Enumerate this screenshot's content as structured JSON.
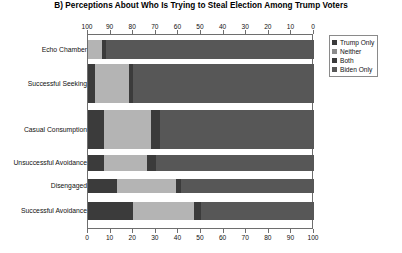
{
  "chart_data": {
    "type": "bar",
    "orientation": "horizontal",
    "stacked": true,
    "stack_mode": "percent",
    "title": "B) Perceptions About Who Is Trying to Steal Election Among Trump Voters",
    "xlabel": "",
    "ylabel": "",
    "xlim": [
      0,
      100
    ],
    "grid": false,
    "legend_position": "right",
    "top_axis": {
      "reversed": true,
      "ticks": [
        100,
        90,
        80,
        70,
        60,
        50,
        40,
        30,
        20,
        10,
        0
      ]
    },
    "bottom_axis": {
      "reversed": false,
      "ticks": [
        0,
        10,
        20,
        30,
        40,
        50,
        60,
        70,
        80,
        90,
        100
      ]
    },
    "categories": [
      "Echo Chamber",
      "Successful Seeking",
      "Casual Consumption",
      "Unsuccessful Avoidance",
      "Disengaged",
      "Successful Avoidance"
    ],
    "series": [
      {
        "name": "Trump Only",
        "color": "#3b3b3b",
        "values": [
          0,
          3,
          7,
          7,
          13,
          20
        ]
      },
      {
        "name": "Neither",
        "color": "#b4b4b4",
        "values": [
          6,
          15,
          21,
          19,
          26,
          27
        ]
      },
      {
        "name": "Both",
        "color": "#3b3b3b",
        "values": [
          2,
          2,
          4,
          4,
          2,
          3
        ]
      },
      {
        "name": "Biden Only",
        "color": "#575757",
        "values": [
          92,
          80,
          68,
          70,
          59,
          50
        ]
      }
    ]
  },
  "legend": {
    "items": [
      {
        "label": "Trump Only",
        "color": "#3b3b3b"
      },
      {
        "label": "Neither",
        "color": "#8c8c8c"
      },
      {
        "label": "Both",
        "color": "#3b3b3b"
      },
      {
        "label": "Biden Only",
        "color": "#575757"
      }
    ]
  },
  "style": {
    "axis_color": "#6e6e6e",
    "background": "#ffffff",
    "text_color": "#111111"
  }
}
